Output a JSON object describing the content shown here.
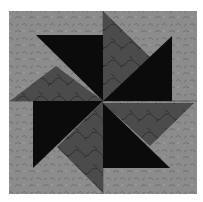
{
  "image": {
    "subject": "Pinwheel quilt block",
    "colors": {
      "background": "#8c8c8c",
      "background_texture": "#7a7a7a",
      "medium": "#4b4b4b",
      "medium_texture": "#3a3a3a",
      "dark": "#0b0b0b",
      "seam": "#5e5e5e"
    },
    "block": {
      "x": 9,
      "y": 11,
      "width": 188,
      "height": 183,
      "center_x": 103,
      "center_y": 101
    },
    "pieces": [
      {
        "name": "dark-blade-top-left",
        "tone": "dark",
        "points": "36,35 103,35 103,101"
      },
      {
        "name": "medium-blade-top-left",
        "tone": "medium",
        "points": "10,101 103,101 56,66"
      },
      {
        "name": "medium-blade-top-right",
        "tone": "medium",
        "points": "103,11 103,101 150,57"
      },
      {
        "name": "dark-blade-top-right",
        "tone": "dark",
        "points": "172,36 172,101 103,101"
      },
      {
        "name": "dark-blade-bottom-left",
        "tone": "dark",
        "points": "33,101 103,101 33,168"
      },
      {
        "name": "medium-blade-bottom-left",
        "tone": "medium",
        "points": "103,101 103,193 57,147"
      },
      {
        "name": "medium-blade-bottom-right",
        "tone": "medium",
        "points": "103,103 194,103 150,146"
      },
      {
        "name": "dark-blade-bottom-right",
        "tone": "dark",
        "points": "103,103 103,168 170,168"
      }
    ]
  }
}
